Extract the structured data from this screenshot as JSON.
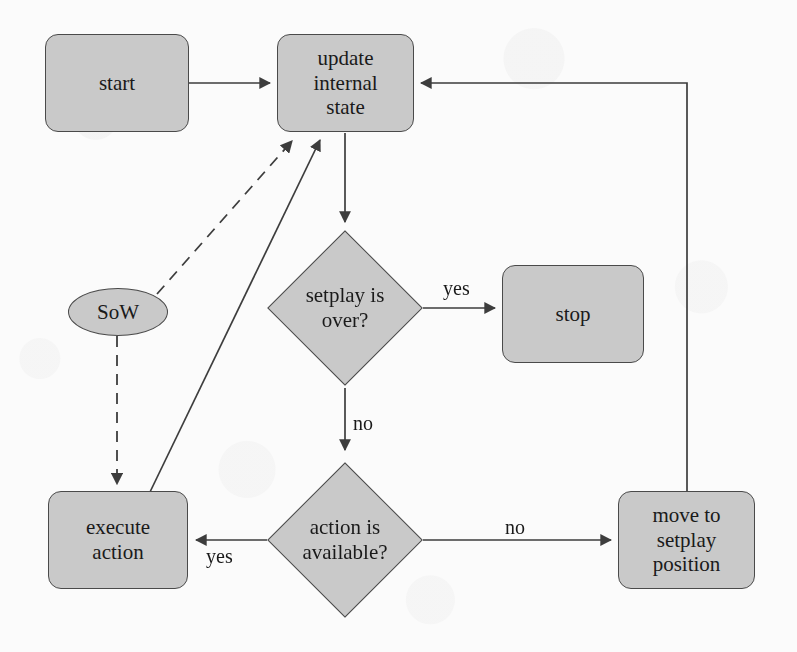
{
  "diagram": {
    "background_color": "#fbfbfb",
    "node_fill_color": "#c9c9c9",
    "node_stroke_color": "#4a4a4a",
    "text_color": "#1a1a1a"
  },
  "nodes": {
    "start": {
      "label": "start",
      "shape": "rounded-rectangle"
    },
    "update_state": {
      "label": "update\ninternal\nstate",
      "shape": "rounded-rectangle"
    },
    "setplay_over": {
      "label": "setplay is\nover?",
      "shape": "diamond"
    },
    "stop": {
      "label": "stop",
      "shape": "rounded-rectangle"
    },
    "action_available": {
      "label": "action is\navailable?",
      "shape": "diamond"
    },
    "execute_action": {
      "label": "execute\naction",
      "shape": "rounded-rectangle"
    },
    "move_setplay": {
      "label": "move to\nsetplay\nposition",
      "shape": "rounded-rectangle"
    },
    "sow": {
      "label": "SoW",
      "shape": "ellipse"
    }
  },
  "edge_labels": {
    "setplay_yes": "yes",
    "setplay_no": "no",
    "action_yes": "yes",
    "action_no": "no"
  },
  "edges": [
    {
      "from": "start",
      "to": "update_state",
      "label": "",
      "style": "solid"
    },
    {
      "from": "update_state",
      "to": "setplay_over",
      "label": "",
      "style": "solid"
    },
    {
      "from": "setplay_over",
      "to": "stop",
      "label": "yes",
      "style": "solid"
    },
    {
      "from": "setplay_over",
      "to": "action_available",
      "label": "no",
      "style": "solid"
    },
    {
      "from": "action_available",
      "to": "execute_action",
      "label": "yes",
      "style": "solid"
    },
    {
      "from": "action_available",
      "to": "move_setplay",
      "label": "no",
      "style": "solid"
    },
    {
      "from": "move_setplay",
      "to": "update_state",
      "label": "",
      "style": "solid"
    },
    {
      "from": "execute_action",
      "to": "update_state",
      "label": "",
      "style": "solid"
    },
    {
      "from": "sow",
      "to": "update_state",
      "label": "",
      "style": "dashed"
    },
    {
      "from": "sow",
      "to": "execute_action",
      "label": "",
      "style": "dashed"
    }
  ]
}
